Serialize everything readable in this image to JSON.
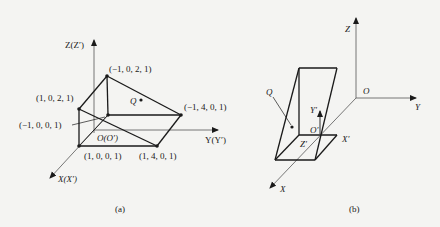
{
  "figure_a": {
    "caption": "(a)",
    "axes": {
      "z_label": "Z(Z′)",
      "y_label": "Y(Y′)",
      "x_label": "X(X′)",
      "origin_label": "O(O′)"
    },
    "points": [
      {
        "label": "(−1, 0, 2, 1)"
      },
      {
        "label": "(1, 0, 2, 1)"
      },
      {
        "label": "(−1, 4, 0, 1)"
      },
      {
        "label": "(−1, 0, 0, 1)"
      },
      {
        "label": "(1, 0, 0, 1)"
      },
      {
        "label": "(1, 4, 0, 1)"
      }
    ],
    "q_label": "Q"
  },
  "figure_b": {
    "caption": "(b)",
    "axes": {
      "z_label": "Z",
      "y_label": "Y",
      "x_label": "X",
      "origin_label": "O",
      "local_y_label": "Y′",
      "local_x_label": "X′",
      "local_z_label": "Z′",
      "local_origin_label": "O′"
    },
    "q_label": "Q"
  },
  "colors": {
    "background": "#f4f4f2",
    "line": "#1a1a1a",
    "axis": "#444444"
  }
}
